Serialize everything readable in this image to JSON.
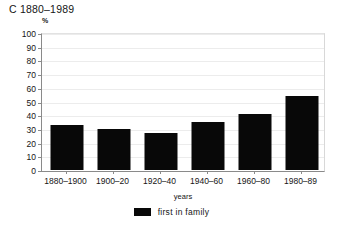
{
  "chart_data": {
    "type": "bar",
    "title": "C 1880–1989",
    "categories": [
      "1880–1900",
      "1900–20",
      "1920–40",
      "1940–60",
      "1960–80",
      "1980–89"
    ],
    "values": [
      33,
      30,
      27,
      35,
      41,
      54
    ],
    "series": [
      {
        "name": "first in family",
        "values": [
          33,
          30,
          27,
          35,
          41,
          54
        ],
        "color": "#080808"
      }
    ],
    "xlabel": "years",
    "ylabel": "%",
    "ylim": [
      0,
      100
    ],
    "ytick_step": 10,
    "yticks": [
      0,
      10,
      20,
      30,
      40,
      50,
      60,
      70,
      80,
      90,
      100
    ],
    "ytick_labels": [
      "0",
      "10",
      "20",
      "30",
      "40",
      "50",
      "60",
      "70",
      "80",
      "90",
      "100"
    ],
    "grid": true,
    "grid_axis": "y",
    "legend_position": "bottom-center",
    "legend": [
      "first in family"
    ],
    "bar_color": "#080808",
    "grid_color": "#ececec",
    "axis_color": "#8a8a8a",
    "background": "#ffffff"
  },
  "legend": {
    "label": "first in family"
  },
  "axes": {
    "y_unit": "%",
    "x_title": "years"
  }
}
